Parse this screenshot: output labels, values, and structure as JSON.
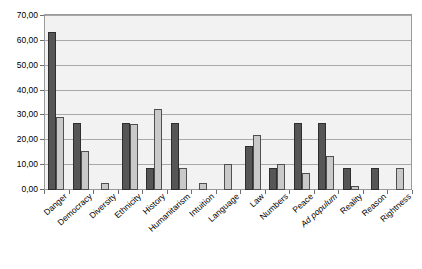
{
  "chart_data": {
    "type": "bar",
    "title": "",
    "subtitle": "",
    "xlabel": "",
    "ylabel": "",
    "ylim": [
      0,
      70
    ],
    "ytick_labels": [
      "0,00",
      "10,00",
      "20,00",
      "30,00",
      "40,00",
      "50,00",
      "60,00",
      "70,00"
    ],
    "ytick_values": [
      0,
      10,
      20,
      30,
      40,
      50,
      60,
      70
    ],
    "grid": true,
    "legend": "none",
    "orientation": "vertical",
    "grouping": "clustered",
    "categories": [
      "Danger",
      "Democracy",
      "Diversity",
      "Ethnicity",
      "History",
      "Humanitarism",
      "Intuition",
      "Language",
      "Law",
      "Numbers",
      "Peace",
      "Ad populum",
      "Reality",
      "Reason",
      "Rightness"
    ],
    "categories_italic": [
      "Ad populum"
    ],
    "series": [
      {
        "name": "Series 1",
        "color": "#565656",
        "values": [
          63.5,
          27.0,
          0,
          27.0,
          8.8,
          27.0,
          0,
          0,
          17.6,
          8.8,
          27.0,
          27.0,
          8.8,
          8.8,
          0
        ]
      },
      {
        "name": "Series 2",
        "color": "#c9c9c9",
        "values": [
          29.5,
          15.7,
          2.8,
          26.5,
          32.5,
          9.0,
          2.8,
          10.6,
          22.0,
          10.6,
          7.0,
          13.5,
          1.5,
          0,
          8.8
        ]
      }
    ]
  },
  "clipped_header_text": ""
}
